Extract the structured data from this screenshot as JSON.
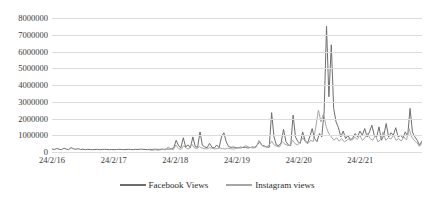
{
  "chart_data": {
    "type": "line",
    "title": "",
    "xlabel": "",
    "ylabel": "",
    "ylim": [
      0,
      8000000
    ],
    "ytick_values": [
      0,
      1000000,
      2000000,
      3000000,
      4000000,
      5000000,
      6000000,
      7000000,
      8000000
    ],
    "ytick_labels": [
      "0",
      "1000000",
      "2000000",
      "3000000",
      "4000000",
      "5000000",
      "6000000",
      "7000000",
      "8000000"
    ],
    "xtick_labels": [
      "24/2/16",
      "24/2/17",
      "24/2/18",
      "24/2/19",
      "24/2/20",
      "24/2/21"
    ],
    "xlim_labels": [
      "24/2/16",
      "24/2/22"
    ],
    "grid": "horizontal",
    "legend_position": "bottom-center",
    "colors": {
      "facebook": "#6e6e6e",
      "instagram": "#a6a6a6",
      "gridline": "#dcdcdc",
      "text": "#3a3a3a",
      "background": "#ffffff"
    },
    "series": [
      {
        "name": "Facebook Views",
        "color": "#6e6e6e",
        "x_start_frac": 0.0,
        "values": [
          180000,
          150000,
          210000,
          160000,
          140000,
          230000,
          170000,
          150000,
          260000,
          190000,
          160000,
          200000,
          150000,
          170000,
          140000,
          160000,
          150000,
          140000,
          150000,
          160000,
          140000,
          150000,
          160000,
          150000,
          140000,
          150000,
          140000,
          150000,
          160000,
          150000,
          140000,
          150000,
          160000,
          150000,
          140000,
          160000,
          150000,
          170000,
          160000,
          150000,
          140000,
          160000,
          150000,
          170000,
          160000,
          150000,
          170000,
          160000,
          180000,
          170000,
          190000,
          250000,
          700000,
          380000,
          260000,
          850000,
          300000,
          420000,
          260000,
          900000,
          320000,
          280000,
          1200000,
          400000,
          300000,
          260000,
          520000,
          280000,
          240000,
          420000,
          260000,
          900000,
          1150000,
          600000,
          320000,
          280000,
          300000,
          260000,
          240000,
          300000,
          260000,
          280000,
          240000,
          260000,
          300000,
          280000,
          420000,
          620000,
          400000,
          360000,
          300000,
          280000,
          2350000,
          900000,
          420000,
          380000,
          560000,
          1350000,
          620000,
          420000,
          380000,
          2200000,
          900000,
          620000,
          520000,
          1200000,
          700000,
          520000,
          900000,
          1400000,
          800000,
          620000,
          1100000,
          900000,
          2400000,
          7500000,
          3300000,
          6400000,
          2600000,
          1800000,
          1450000,
          900000,
          1250000,
          800000,
          1000000,
          700000,
          850000,
          1100000,
          900000,
          1250000,
          1000000,
          1400000,
          900000,
          1200000,
          1600000,
          1000000,
          900000,
          1500000,
          700000,
          1000000,
          1700000,
          900000,
          1150000,
          1000000,
          1450000,
          900000,
          1000000,
          850000,
          1200000,
          950000,
          2600000,
          1200000,
          900000,
          700000,
          400000,
          650000
        ]
      },
      {
        "name": "Instagram views",
        "color": "#a6a6a6",
        "x_start_frac": 0.265,
        "values": [
          120000,
          100000,
          140000,
          110000,
          130000,
          160000,
          120000,
          300000,
          180000,
          140000,
          420000,
          200000,
          160000,
          380000,
          220000,
          180000,
          500000,
          260000,
          200000,
          320000,
          240000,
          200000,
          180000,
          260000,
          220000,
          180000,
          200000,
          240000,
          200000,
          180000,
          220000,
          200000,
          180000,
          200000,
          260000,
          220000,
          300000,
          380000,
          300000,
          260000,
          240000,
          280000,
          700000,
          420000,
          320000,
          300000,
          420000,
          650000,
          400000,
          340000,
          300000,
          620000,
          480000,
          400000,
          380000,
          700000,
          500000,
          420000,
          600000,
          850000,
          600000,
          500000,
          700000,
          620000,
          1500000,
          2500000,
          1800000,
          2300000,
          1500000,
          1100000,
          900000,
          700000,
          850000,
          650000,
          800000,
          600000,
          700000,
          820000,
          700000,
          900000,
          750000,
          1000000,
          700000,
          850000,
          1100000,
          800000,
          700000,
          1000000,
          600000,
          750000,
          1200000,
          700000,
          850000,
          780000,
          1000000,
          700000,
          800000,
          650000,
          900000,
          720000,
          1400000,
          900000,
          700000,
          560000,
          340000,
          520000
        ]
      }
    ]
  },
  "legend": {
    "items": [
      {
        "label": "Facebook Views"
      },
      {
        "label": "Instagram views"
      }
    ]
  }
}
